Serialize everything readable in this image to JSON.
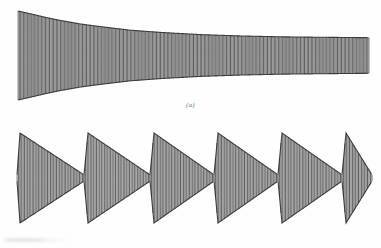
{
  "figure": {
    "background_color": "#fefefe",
    "ink_color": "#2b2b2b",
    "caption_color": "#7b7b7b",
    "width": 381,
    "height": 248
  },
  "panels": [
    {
      "id": "a",
      "caption": "(a)",
      "description": "damped-sinusoid-trace"
    },
    {
      "id": "b",
      "caption": "(b)",
      "description": "beat-burst-trace"
    }
  ],
  "chart_data": [
    {
      "type": "line",
      "title": "(a)",
      "subtitle": "",
      "xlabel": "",
      "ylabel": "",
      "grid": false,
      "legend": "none",
      "xlim": [
        0,
        381
      ],
      "ylim": [
        -1,
        1
      ],
      "waveform": {
        "kind": "decaying-sinusoid",
        "x_start": 18,
        "x_end": 369,
        "baseline_y": 55,
        "carrier_cycles": 128,
        "envelope_type": "exponential-decay-to-plateau",
        "envelope_start_amplitude": 1.0,
        "envelope_end_amplitude": 0.4,
        "envelope_decay_constant": 0.0155,
        "envelope_points": [
          {
            "x": 18,
            "amp": 1.0
          },
          {
            "x": 30,
            "amp": 0.94
          },
          {
            "x": 45,
            "amp": 0.86
          },
          {
            "x": 60,
            "amp": 0.79
          },
          {
            "x": 80,
            "amp": 0.71
          },
          {
            "x": 100,
            "amp": 0.65
          },
          {
            "x": 130,
            "amp": 0.57
          },
          {
            "x": 160,
            "amp": 0.52
          },
          {
            "x": 200,
            "amp": 0.47
          },
          {
            "x": 240,
            "amp": 0.44
          },
          {
            "x": 280,
            "amp": 0.42
          },
          {
            "x": 320,
            "amp": 0.41
          },
          {
            "x": 369,
            "amp": 0.4
          }
        ],
        "peak_pixel_top": 11,
        "peak_pixel_bottom": 100,
        "plateau_pixel_top": 30,
        "plateau_pixel_bottom": 81
      }
    },
    {
      "type": "line",
      "title": "(b)",
      "subtitle": "",
      "xlabel": "",
      "ylabel": "",
      "grid": false,
      "legend": "none",
      "xlim": [
        0,
        381
      ],
      "ylim": [
        -1,
        1
      ],
      "waveform": {
        "kind": "repeated-decaying-bursts",
        "x_start": 17,
        "x_end": 372,
        "baseline_y": 54,
        "burst_count": 6,
        "burst_period": 68,
        "carrier_cycles_per_burst": 22,
        "burst_envelope": "triangular-decay",
        "burst_peak_amplitude": 1.0,
        "burst_node_amplitude": 0.07,
        "bursts": [
          {
            "index": 1,
            "x_start": 17,
            "x_peak": 20,
            "x_node": 84
          },
          {
            "index": 2,
            "x_start": 84,
            "x_peak": 88,
            "x_node": 150
          },
          {
            "index": 3,
            "x_start": 150,
            "x_peak": 154,
            "x_node": 214
          },
          {
            "index": 4,
            "x_start": 214,
            "x_peak": 218,
            "x_node": 278
          },
          {
            "index": 5,
            "x_start": 278,
            "x_peak": 282,
            "x_node": 342
          },
          {
            "index": 6,
            "x_start": 342,
            "x_peak": 346,
            "x_node": 372
          }
        ],
        "peak_pixel_top": 9,
        "peak_pixel_bottom": 99
      }
    }
  ]
}
